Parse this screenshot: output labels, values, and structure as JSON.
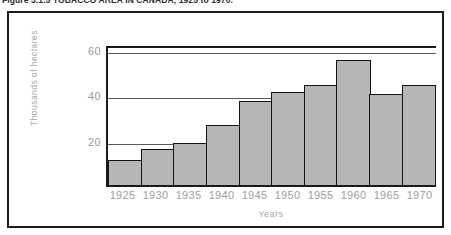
{
  "figure": {
    "caption": "Figure 3.1.5 TOBACCO AREA IN CANADA, 1925 to 1970."
  },
  "colors": {
    "bar_fill": "#b6b6b6",
    "bar_border": "#141414",
    "frame_border": "#1c1c1c",
    "axis_line": "#1a1a1a",
    "gridline": "#585858",
    "label_text": "#9a9a9a"
  },
  "chart_data": {
    "type": "bar",
    "title": "Figure 3.1.5 TOBACCO AREA IN CANADA, 1925 to 1970.",
    "xlabel": "Years",
    "ylabel": "Thousands of hectares",
    "categories": [
      "1925",
      "1930",
      "1935",
      "1940",
      "1945",
      "1950",
      "1955",
      "1960",
      "1965",
      "1970"
    ],
    "values": [
      11,
      16,
      18.5,
      26.5,
      37,
      41,
      44,
      55,
      40,
      44
    ],
    "ylim": [
      0,
      62
    ],
    "yticks": [
      20,
      40,
      60
    ],
    "ytick_labels": [
      "20",
      "40",
      "60"
    ],
    "grid": true,
    "grid_axis": "y",
    "legend": false,
    "series": [
      {
        "name": "Tobacco area",
        "values": [
          11,
          16,
          18.5,
          26.5,
          37,
          41,
          44,
          55,
          40,
          44
        ]
      }
    ]
  }
}
